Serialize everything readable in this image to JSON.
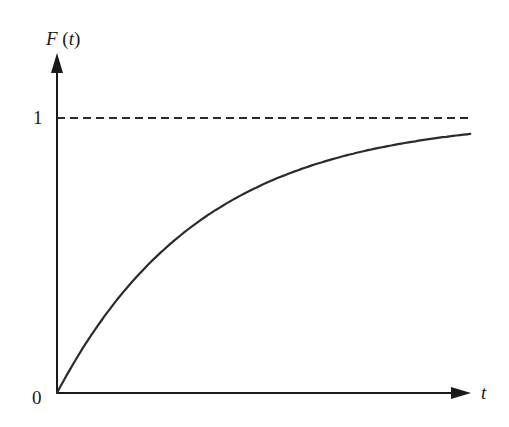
{
  "chart_data": {
    "type": "line",
    "title": "",
    "ylabel": "F (t)",
    "xlabel": "t",
    "y_ticks": [
      {
        "value": 0,
        "label": "0"
      },
      {
        "value": 1,
        "label": "1"
      }
    ],
    "x_ticks": [],
    "ylim": [
      0,
      1.23
    ],
    "xlim": [
      0,
      2.86
    ],
    "grid": false,
    "legend": null,
    "reference_lines": [
      {
        "orientation": "horizontal",
        "y": 1,
        "style": "dashed",
        "label": "asymptote F = 1"
      }
    ],
    "series": [
      {
        "name": "F(t) = 1 - e^(-t)",
        "style": "solid",
        "x": [
          0,
          0.25,
          0.5,
          0.75,
          1.0,
          1.25,
          1.5,
          1.75,
          2.0,
          2.25,
          2.5,
          2.75,
          2.85
        ],
        "y": [
          0,
          0.221,
          0.393,
          0.528,
          0.632,
          0.713,
          0.777,
          0.826,
          0.865,
          0.895,
          0.918,
          0.936,
          0.942
        ]
      }
    ],
    "colors": {
      "axis": "#1a1a1a",
      "curve": "#2b2b2b",
      "asymptote": "#2b2b2b",
      "background": "#ffffff"
    }
  },
  "labels": {
    "y_axis": "F (t)",
    "x_axis": "t",
    "y_one": "1",
    "origin": "0"
  }
}
